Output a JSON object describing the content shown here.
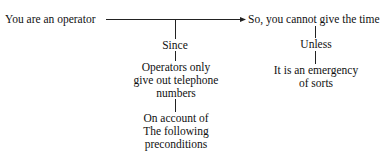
{
  "diagram": {
    "nodes": {
      "premise": "You are an operator",
      "conclusion": "So, you cannot give the time",
      "since_label": "Since",
      "reason_line1": "Operators only",
      "reason_line2": "give out telephone",
      "reason_line3": "numbers",
      "account_line1": "On account of",
      "account_line2": "The following",
      "account_line3": "preconditions",
      "unless_label": "Unless",
      "rebuttal_line1": "It is an emergency",
      "rebuttal_line2": "of sorts"
    },
    "edges": [
      {
        "from": "premise",
        "to": "conclusion",
        "type": "arrow"
      },
      {
        "from": "premise-conclusion",
        "to": "since_label",
        "type": "line"
      },
      {
        "from": "since_label",
        "to": "reason",
        "type": "line"
      },
      {
        "from": "reason",
        "to": "account",
        "type": "line"
      },
      {
        "from": "conclusion",
        "to": "unless_label",
        "type": "line"
      },
      {
        "from": "unless_label",
        "to": "rebuttal",
        "type": "line"
      }
    ]
  }
}
